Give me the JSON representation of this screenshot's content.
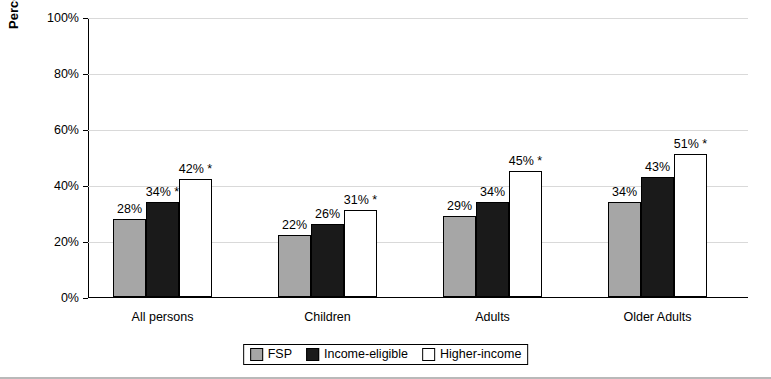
{
  "chart_data": {
    "type": "bar",
    "title": "",
    "xlabel": "",
    "ylabel": "Percent of persons",
    "ylim": [
      0,
      100
    ],
    "ytick_labels": [
      "0%",
      "20%",
      "40%",
      "60%",
      "80%",
      "100%"
    ],
    "ytick_values": [
      0,
      20,
      40,
      60,
      80,
      100
    ],
    "grid": true,
    "legend_position": "bottom",
    "categories": [
      "All persons",
      "Children",
      "Adults",
      "Older Adults"
    ],
    "series": [
      {
        "name": "FSP",
        "color": "#a6a6a6",
        "values": [
          28,
          22,
          29,
          34
        ],
        "labels": [
          "28%",
          "22%",
          "29%",
          "34%"
        ]
      },
      {
        "name": "Income-eligible",
        "color": "#1a1a1a",
        "values": [
          34,
          26,
          34,
          43
        ],
        "labels": [
          "34% *",
          "26%",
          "34%",
          "43%"
        ]
      },
      {
        "name": "Higher-income",
        "color": "#ffffff",
        "values": [
          42,
          31,
          45,
          51
        ],
        "labels": [
          "42% *",
          "31% *",
          "45% *",
          "51% *"
        ]
      }
    ]
  }
}
